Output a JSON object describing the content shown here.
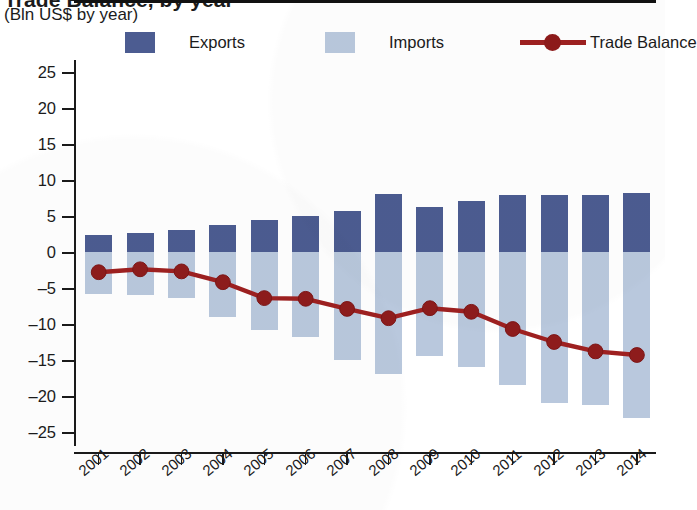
{
  "title": {
    "main": "Trade Balance, by year",
    "sub": "(Bln US$ by year)"
  },
  "legend": {
    "exports": {
      "label": "Exports",
      "color": "#4c5c91",
      "icon": "square-swatch-icon"
    },
    "imports": {
      "label": "Imports",
      "color": "#b9c8dd",
      "icon": "square-swatch-icon"
    },
    "balance": {
      "label": "Trade Balance",
      "color": "#9e2020",
      "icon": "line-marker-icon"
    }
  },
  "axes": {
    "y_ticks": [
      "25",
      "20",
      "15",
      "10",
      "5",
      "0",
      "–5",
      "–10",
      "–15",
      "–20",
      "–25"
    ],
    "x_ticks": [
      "2001",
      "2002",
      "2003",
      "2004",
      "2005",
      "2006",
      "2007",
      "2008",
      "2009",
      "2010",
      "2011",
      "2012",
      "2013",
      "2014"
    ]
  },
  "chart_data": {
    "type": "bar",
    "title": "Trade Balance, by year",
    "subtitle": "(Bln US$ by year)",
    "xlabel": "",
    "ylabel": "Bln US$",
    "ylim": [
      -25,
      25
    ],
    "ytick_step": 5,
    "grid": false,
    "legend_position": "top",
    "categories": [
      "2001",
      "2002",
      "2003",
      "2004",
      "2005",
      "2006",
      "2007",
      "2008",
      "2009",
      "2010",
      "2011",
      "2012",
      "2013",
      "2014"
    ],
    "series": [
      {
        "name": "Exports",
        "type": "bar",
        "color": "#4c5c91",
        "values": [
          2.3,
          2.6,
          3.0,
          3.8,
          4.5,
          5.0,
          5.7,
          8.0,
          6.3,
          7.1,
          7.9,
          7.9,
          7.9,
          8.2
        ]
      },
      {
        "name": "Imports",
        "type": "bar",
        "color": "#b9c8dd",
        "values": [
          -5.8,
          -6.0,
          -6.4,
          -9.0,
          -10.8,
          -11.8,
          -15.0,
          -17.0,
          -14.5,
          -16.0,
          -18.5,
          -21.0,
          -21.3,
          -23.0
        ]
      },
      {
        "name": "Trade Balance",
        "type": "line",
        "color": "#9e2020",
        "values": [
          -2.8,
          -2.4,
          -2.7,
          -4.2,
          -6.4,
          -6.5,
          -7.9,
          -9.2,
          -7.8,
          -8.3,
          -10.7,
          -12.5,
          -13.8,
          -14.3
        ]
      }
    ]
  }
}
